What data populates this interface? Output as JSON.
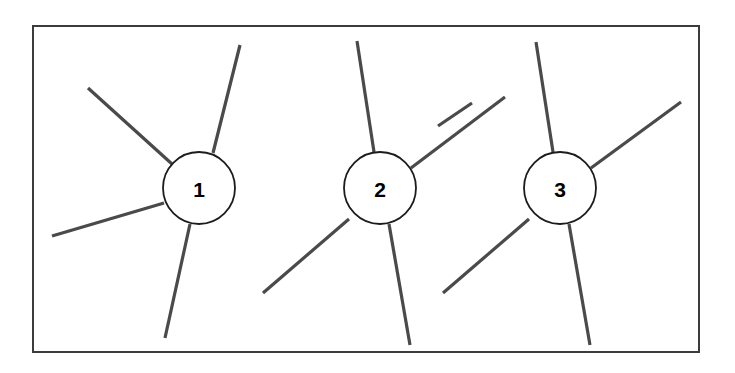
{
  "diagram": {
    "background_color": "#ffffff",
    "canvas": {
      "width": 735,
      "height": 373
    },
    "frame": {
      "name": "outer-border",
      "x": 33,
      "y": 26,
      "width": 666,
      "height": 326,
      "stroke_color": "#3c3c3c",
      "stroke_width": 2,
      "fill_color": "#ffffff"
    },
    "style": {
      "line_color": "#4a4a4a",
      "line_width": 3.2,
      "circle_stroke_color": "#1c1c1c",
      "circle_stroke_width": 1.8,
      "circle_fill_color": "#ffffff",
      "label_color": "#000000",
      "label_font_size": 21
    },
    "nodes": [
      {
        "id": "node-1",
        "label": "1",
        "cx": 199,
        "cy": 188,
        "r": 36,
        "spoke_count": 4,
        "spokes": [
          {
            "id": "node-1-spoke-upper-left",
            "direction": "upper-left",
            "x1": 88,
            "y1": 88,
            "x2": 172,
            "y2": 164
          },
          {
            "id": "node-1-spoke-upper-right",
            "direction": "upper-right",
            "x1": 240,
            "y1": 45,
            "x2": 213,
            "y2": 153
          },
          {
            "id": "node-1-spoke-lower-left",
            "direction": "lower-left",
            "x1": 52,
            "y1": 236,
            "x2": 164,
            "y2": 203
          },
          {
            "id": "node-1-spoke-lower-right",
            "direction": "lower-right",
            "x1": 190,
            "y1": 224,
            "x2": 165,
            "y2": 338
          }
        ]
      },
      {
        "id": "node-2",
        "label": "2",
        "cx": 380,
        "cy": 188,
        "r": 36,
        "spoke_count": 4,
        "spokes": [
          {
            "id": "node-2-spoke-up",
            "direction": "up",
            "x1": 357,
            "y1": 41,
            "x2": 374,
            "y2": 152
          },
          {
            "id": "node-2-spoke-upper-right",
            "direction": "upper-right",
            "x1": 505,
            "y1": 97,
            "x2": 411,
            "y2": 168
          },
          {
            "id": "node-2-spoke-lower-left",
            "direction": "lower-left",
            "x1": 263,
            "y1": 293,
            "x2": 349,
            "y2": 219
          },
          {
            "id": "node-2-spoke-down",
            "direction": "down",
            "x1": 389,
            "y1": 224,
            "x2": 410,
            "y2": 345
          }
        ]
      },
      {
        "id": "node-3",
        "label": "3",
        "cx": 560,
        "cy": 188,
        "r": 36,
        "spoke_count": 4,
        "spokes": [
          {
            "id": "node-3-spoke-up",
            "direction": "up",
            "x1": 536,
            "y1": 42,
            "x2": 553,
            "y2": 152
          },
          {
            "id": "node-3-spoke-upper-right",
            "direction": "upper-right",
            "x1": 681,
            "y1": 102,
            "x2": 591,
            "y2": 168
          },
          {
            "id": "node-3-spoke-lower-left",
            "direction": "lower-left",
            "x1": 443,
            "y1": 293,
            "x2": 529,
            "y2": 219
          },
          {
            "id": "node-3-spoke-down",
            "direction": "down",
            "x1": 569,
            "y1": 224,
            "x2": 590,
            "y2": 345
          }
        ]
      }
    ],
    "extra_spokes": [
      {
        "id": "left-edge-spoke-into-node-3",
        "direction": "upper-left-outside",
        "x1": 438,
        "y1": 126,
        "x2": 472,
        "y2": 103
      }
    ]
  }
}
